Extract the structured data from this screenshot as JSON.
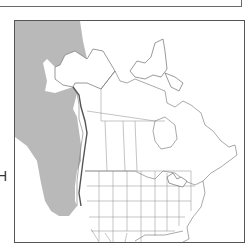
{
  "figure": {
    "type": "species-range-map",
    "region": "North America",
    "edge_text": "H",
    "legend": [],
    "colors": {
      "range_fill": "#b9b9b9",
      "land": "#ffffff",
      "border": "#6f6f6f",
      "frame": "#555555"
    },
    "range": {
      "description": "Shaded range along the Pacific coast and offshore waters from the Gulf of Alaska / Bering Sea south to California",
      "areas": [
        "Bering Sea",
        "Gulf of Alaska",
        "Pacific coast of British Columbia",
        "Pacific coast of Washington",
        "Pacific coast of Oregon",
        "Pacific coast of California"
      ]
    }
  }
}
